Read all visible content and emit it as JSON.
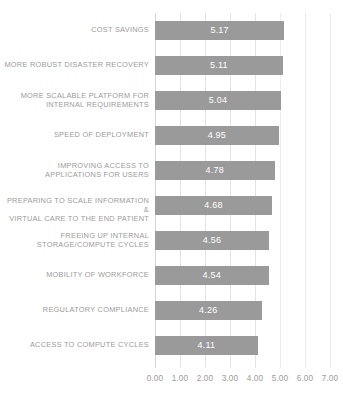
{
  "chart_data": {
    "type": "bar",
    "orientation": "horizontal",
    "title": "",
    "xlabel": "",
    "ylabel": "",
    "xlim": [
      0,
      7
    ],
    "xticks": [
      "0.00",
      "1.00",
      "2.00",
      "3.00",
      "4.00",
      "5.00",
      "6.00",
      "7.00"
    ],
    "xtick_values": [
      0,
      1,
      2,
      3,
      4,
      5,
      6,
      7
    ],
    "grid": true,
    "legend": "none",
    "bar_color": "#9a9a9a",
    "label_color": "#9b9b9b",
    "value_label_color": "#ffffff",
    "categories": [
      "COST SAVINGS",
      "MORE ROBUST DISASTER RECOVERY",
      "MORE SCALABLE PLATFORM FOR INTERNAL REQUIREMENTS",
      "SPEED OF DEPLOYMENT",
      "IMPROVING ACCESS TO APPLICATIONS FOR USERS",
      "PREPARING TO SCALE INFORMATION & VIRTUAL CARE TO THE END PATIENT",
      "FREEING UP INTERNAL STORAGE/COMPUTE CYCLES",
      "MOBILITY OF WORKFORCE",
      "REGULATORY COMPLIANCE",
      "ACCESS TO COMPUTE CYCLES"
    ],
    "category_lines": [
      [
        "COST SAVINGS"
      ],
      [
        "MORE ROBUST DISASTER RECOVERY"
      ],
      [
        "MORE SCALABLE PLATFORM FOR",
        "INTERNAL REQUIREMENTS"
      ],
      [
        "SPEED OF DEPLOYMENT"
      ],
      [
        "IMPROVING ACCESS TO",
        "APPLICATIONS FOR USERS"
      ],
      [
        "PREPARING TO SCALE INFORMATION &",
        "VIRTUAL CARE TO THE END PATIENT"
      ],
      [
        "FREEING UP INTERNAL",
        "STORAGE/COMPUTE CYCLES"
      ],
      [
        "MOBILITY OF WORKFORCE"
      ],
      [
        "REGULATORY COMPLIANCE"
      ],
      [
        "ACCESS TO COMPUTE CYCLES"
      ]
    ],
    "values": [
      5.17,
      5.11,
      5.04,
      4.95,
      4.78,
      4.68,
      4.56,
      4.54,
      4.26,
      4.11
    ],
    "value_labels": [
      "5.17",
      "5.11",
      "5.04",
      "4.95",
      "4.78",
      "4.68",
      "4.56",
      "4.54",
      "4.26",
      "4.11"
    ]
  }
}
